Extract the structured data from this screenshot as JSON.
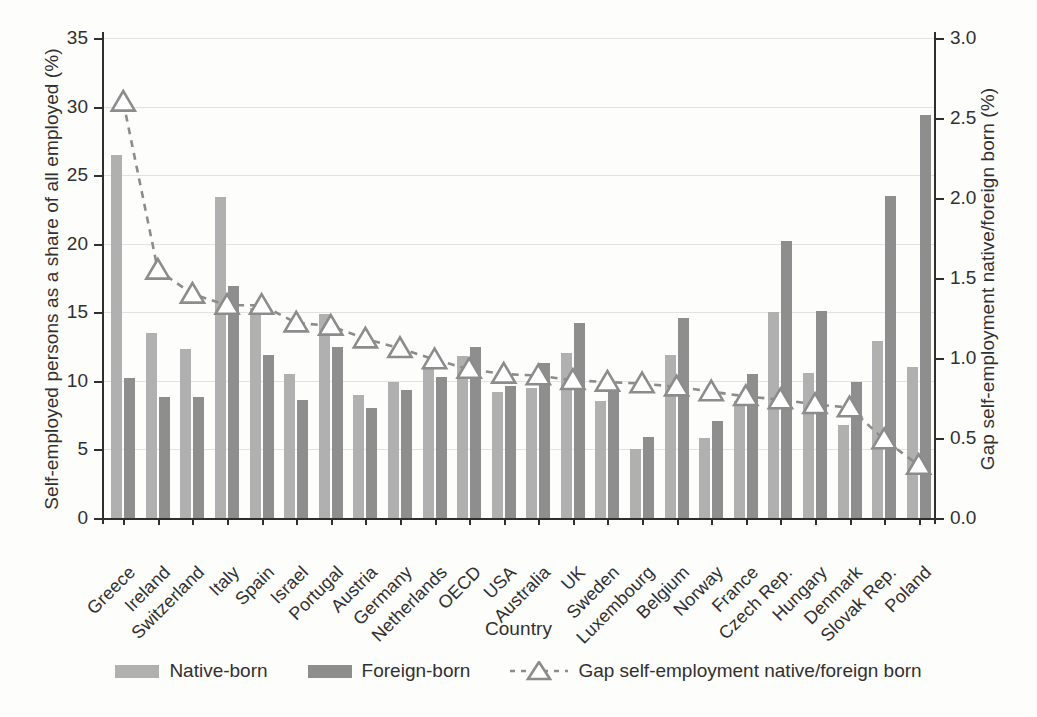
{
  "chart_data": {
    "type": "bar",
    "title": "",
    "xlabel": "Country",
    "ylabel": "Self-employed persons as a share of all employed (%)",
    "ylabel_right": "Gap self-employment native/foreign born (%)",
    "ylim": [
      0,
      35
    ],
    "yticks": [
      "0",
      "5",
      "10",
      "15",
      "20",
      "25",
      "30",
      "35"
    ],
    "ylim_right": [
      0,
      3.0
    ],
    "yticks_right": [
      "0.0",
      "0.5",
      "1.0",
      "1.5",
      "2.0",
      "2.5",
      "3.0"
    ],
    "grid": true,
    "legend_position": "bottom",
    "categories": [
      "Greece",
      "Ireland",
      "Switzerland",
      "Italy",
      "Spain",
      "Israel",
      "Portugal",
      "Austria",
      "Germany",
      "Netherlands",
      "OECD",
      "USA",
      "Australia",
      "UK",
      "Sweden",
      "Luxembourg",
      "Belgium",
      "Norway",
      "France",
      "Czech Rep.",
      "Hungary",
      "Denmark",
      "Slovak Rep.",
      "Poland"
    ],
    "series": [
      {
        "name": "Native-born",
        "type": "bar",
        "color": "#b0b0b0",
        "values": [
          26.5,
          13.5,
          12.3,
          23.4,
          15.3,
          10.5,
          14.9,
          9.0,
          9.9,
          11.0,
          11.8,
          9.2,
          9.5,
          12.0,
          8.5,
          5.0,
          11.9,
          5.8,
          8.5,
          15.0,
          10.6,
          6.8,
          12.9,
          11.0
        ]
      },
      {
        "name": "Foreign-born",
        "type": "bar",
        "color": "#8e8e8e",
        "values": [
          10.2,
          8.8,
          8.8,
          16.9,
          11.9,
          8.6,
          12.5,
          8.0,
          9.3,
          10.3,
          12.5,
          9.6,
          11.3,
          14.2,
          9.3,
          5.9,
          14.6,
          7.1,
          10.5,
          20.2,
          15.1,
          9.9,
          23.5,
          29.4
        ]
      },
      {
        "name": "Gap self-employment native/foreign born",
        "type": "line",
        "axis": "right",
        "color": "#8c8c8c",
        "marker": "triangle-up",
        "linestyle": "dashed",
        "values": [
          2.6,
          1.55,
          1.4,
          1.33,
          1.33,
          1.22,
          1.2,
          1.12,
          1.06,
          0.99,
          0.93,
          0.9,
          0.89,
          0.86,
          0.85,
          0.84,
          0.82,
          0.79,
          0.76,
          0.74,
          0.71,
          0.69,
          0.49,
          0.33
        ]
      }
    ]
  },
  "legend": {
    "items": [
      {
        "label": "Native-born",
        "swatch": "#b0b0b0"
      },
      {
        "label": "Foreign-born",
        "swatch": "#8e8e8e"
      },
      {
        "label": "Gap self-employment native/foreign born",
        "swatch": "#8c8c8c"
      }
    ]
  }
}
